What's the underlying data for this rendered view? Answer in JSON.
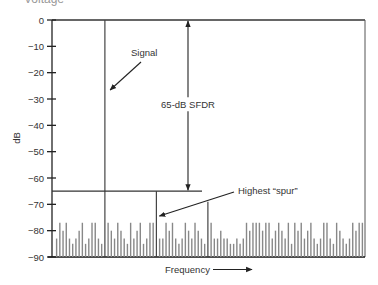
{
  "header": {
    "cut_text": "Voltage"
  },
  "chart_data": {
    "type": "bar",
    "title": "",
    "xlabel": "Frequency",
    "ylabel": "dB",
    "ylim": [
      -90,
      0
    ],
    "yticks": [
      0,
      -10,
      -20,
      -30,
      -40,
      -50,
      -60,
      -70,
      -80,
      -90
    ],
    "ytick_labels": [
      "0",
      "−10",
      "−20",
      "−30",
      "−40",
      "−50",
      "−60",
      "−70",
      "−80",
      "−90"
    ],
    "grid": false,
    "legend": null,
    "signal": {
      "label": "Signal",
      "bin": 16,
      "value": 0
    },
    "highest_spur": {
      "label": "Highest “spur”",
      "bin": 31,
      "value": -65
    },
    "secondary_spur": {
      "bin": 47,
      "value": -69
    },
    "sfdr": {
      "label": "65-dB SFDR",
      "top": 0,
      "bottom": -65,
      "value_db": 65
    },
    "noise_floor_values": [
      -83,
      -77,
      -80,
      -77,
      -83,
      -85,
      -83,
      -80,
      -77,
      -85,
      -83,
      -77,
      -77,
      -83,
      -85,
      0,
      -77,
      -80,
      -83,
      -77,
      -80,
      -83,
      -85,
      -77,
      -83,
      -80,
      -77,
      -85,
      -83,
      -77,
      -77,
      -65,
      -83,
      -83,
      -77,
      -80,
      -77,
      -83,
      -85,
      -83,
      -77,
      -80,
      -83,
      -77,
      -80,
      -83,
      -85,
      -69,
      -77,
      -83,
      -83,
      -80,
      -83,
      -83,
      -85,
      -85,
      -83,
      -85,
      -83,
      -77,
      -80,
      -77,
      -77,
      -77,
      -80,
      -77,
      -77,
      -83,
      -80,
      -77,
      -80,
      -83,
      -77,
      -85,
      -77,
      -80,
      -77,
      -83,
      -80,
      -77,
      -83,
      -85,
      -83,
      -77,
      -77,
      -83,
      -85,
      -77,
      -80,
      -83,
      -85,
      -83,
      -77,
      -80,
      -77,
      -77
    ],
    "annotations": [
      {
        "text": "Signal",
        "arrow_to": "signal line near -27 dB"
      },
      {
        "text": "65-dB SFDR",
        "arrow": "double-headed, 0 to -65 dB"
      },
      {
        "text": "Highest “spur”",
        "arrow_to": "spur at -65 dB"
      },
      {
        "text": "Frequency",
        "arrow": "right-pointing"
      }
    ]
  }
}
